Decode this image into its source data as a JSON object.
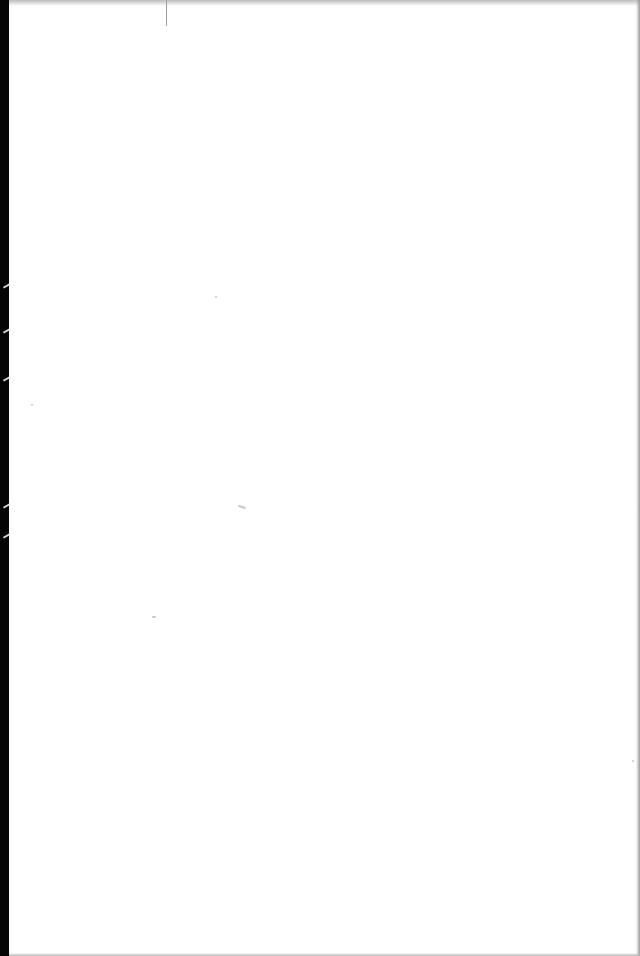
{
  "page": {
    "type": "blank scanned page",
    "text": "",
    "colors": {
      "paper": "#ffffff",
      "left_edge": "#050505",
      "edge_shadow": "#bdbdbd",
      "fold_mark": "#9e9e9e"
    }
  }
}
